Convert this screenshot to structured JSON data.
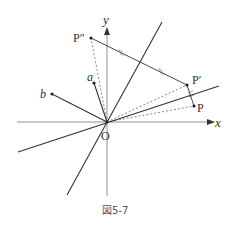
{
  "figure": {
    "caption": "図5-7",
    "labels": {
      "x_axis": "x",
      "y_axis": "y",
      "origin": "O",
      "P": "P",
      "P_prime": "P′",
      "P_double_prime": "P″",
      "a": "a",
      "b": "b"
    },
    "points": {
      "O": [
        107,
        122
      ],
      "P": [
        194,
        106
      ],
      "P_prime": [
        187,
        85
      ],
      "P_double_prime": [
        91,
        38
      ],
      "a": [
        94,
        83
      ],
      "b": [
        52,
        94
      ]
    },
    "colors": {
      "line": "#333333",
      "axis": "#777777",
      "dashed": "#555555"
    }
  }
}
